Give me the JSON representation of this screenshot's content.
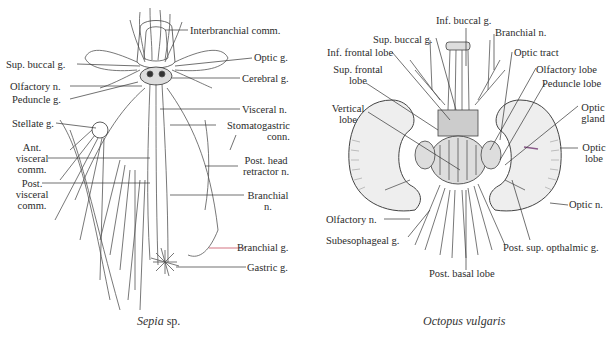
{
  "figure": {
    "sepia": {
      "caption_genus": "Sepia",
      "caption_suffix": " sp.",
      "labels": {
        "interbranchial_comm": "Interbranchial comm.",
        "optic_g": "Optic g.",
        "sup_buccal_g": "Sup. buccal g.",
        "cerebral_g": "Cerebral g.",
        "olfactory_n": "Olfactory n.",
        "peduncle_g": "Peduncle g.",
        "visceral_n": "Visceral n.",
        "stellate_g": "Stellate g.",
        "stomatogastric_conn_1": "Stomatogastric",
        "stomatogastric_conn_2": "conn.",
        "ant_visceral_comm_1": "Ant.",
        "ant_visceral_comm_2": "visceral",
        "ant_visceral_comm_3": "comm.",
        "post_head_retractor_1": "Post. head",
        "post_head_retractor_2": "retractor n.",
        "post_visceral_comm_1": "Post.",
        "post_visceral_comm_2": "visceral",
        "post_visceral_comm_3": "comm.",
        "branchial_n_1": "Branchial",
        "branchial_n_2": "n.",
        "branchial_g": "Branchial g.",
        "gastric_g": "Gastric g."
      }
    },
    "octopus": {
      "caption": "Octopus vulgaris",
      "labels": {
        "inf_buccal_g": "Inf. buccal g.",
        "sup_buccal_g": "Sup. buccal g.",
        "branchial_n": "Branchial n.",
        "inf_frontal_lobe": "Inf. frontal lobe",
        "optic_tract": "Optic tract",
        "sup_frontal_lobe_1": "Sup. frontal",
        "sup_frontal_lobe_2": "lobe",
        "olfactory_lobe": "Olfactory lobe",
        "peduncle_lobe": "Peduncle lobe",
        "vertical_lobe_1": "Vertical",
        "vertical_lobe_2": "lobe",
        "optic_gland_1": "Optic",
        "optic_gland_2": "gland",
        "optic_lobe_1": "Optic",
        "optic_lobe_2": "lobe",
        "optic_n": "Optic n.",
        "olfactory_n": "Olfactory n.",
        "subesophageal_g": "Subesophageal g.",
        "post_sup_ophthalmic_g": "Post. sup. opthalmic g.",
        "post_basal_lobe": "Post. basal lobe"
      }
    },
    "colors": {
      "ink": "#2b2b2b",
      "accent_leader": "#c0384a",
      "purple_mark": "#8a5a8a"
    }
  }
}
